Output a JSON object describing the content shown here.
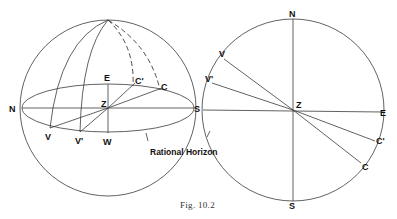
{
  "figure": {
    "caption": "Fig. 10.2",
    "horizon_label": "Rational Horizon"
  },
  "left_sphere": {
    "labels": {
      "north": "N",
      "south": "S",
      "east": "E",
      "west": "W",
      "zenith": "Z",
      "v": "V",
      "v_prime": "V'",
      "c": "C",
      "c_prime": "C'"
    }
  },
  "right_circle": {
    "labels": {
      "north": "N",
      "south": "S",
      "east": "E",
      "zenith": "Z",
      "v": "V",
      "v_prime": "V'",
      "c": "C",
      "c_prime": "C'"
    }
  }
}
